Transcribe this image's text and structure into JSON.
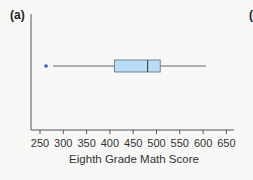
{
  "panel": {
    "label": "(a)",
    "next_panel_label_partial": "("
  },
  "colors": {
    "box_fill": "#b9dcf7",
    "box_stroke": "#5c6d80",
    "whisker": "#666666",
    "outlier": "#3a5fcd",
    "axis": "#555555"
  },
  "chart_data": {
    "type": "boxplot",
    "title": "",
    "xlabel": "Eighth Grade Math Score",
    "ylabel": "",
    "xlim": [
      240,
      660
    ],
    "x_ticks": [
      250,
      300,
      350,
      400,
      450,
      500,
      550,
      600,
      650
    ],
    "x_tick_labels": [
      "250",
      "300",
      "350",
      "400",
      "450",
      "500",
      "550",
      "600",
      "650"
    ],
    "grid": false,
    "legend": null,
    "orientation": "horizontal",
    "series": [
      {
        "name": "Eighth Grade Math Score",
        "whisker_low": 278,
        "q1": 410,
        "median": 481,
        "q3": 508,
        "whisker_high": 606,
        "outliers": [
          263
        ]
      }
    ]
  }
}
